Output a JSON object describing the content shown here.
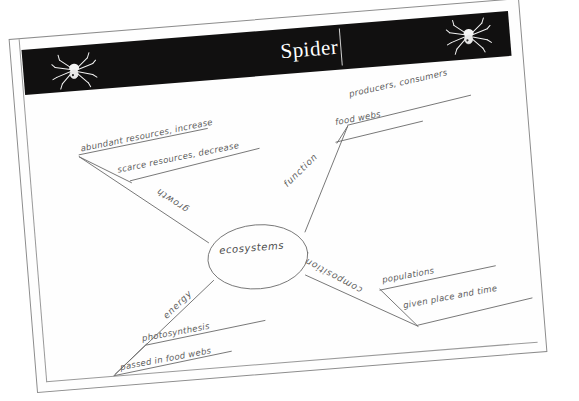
{
  "document": {
    "type": "worksheet-scan",
    "banner": {
      "title": "Spider",
      "background_color": "#111010",
      "title_color": "#ffffff",
      "left_icon": "spider-icon",
      "right_icon": "spider-icon"
    },
    "paper_color": "#fefefe",
    "ink_color": "#5d5d5d"
  },
  "concept_map": {
    "center": {
      "label": "ecosystems"
    },
    "branches": [
      {
        "label": "growth",
        "direction": "upper-left",
        "sub_labels": [
          "abundant resources, increase",
          "scarce resources, decrease"
        ]
      },
      {
        "label": "function",
        "direction": "upper-right",
        "sub_labels": [
          "producers, consumers",
          "food webs"
        ]
      },
      {
        "label": "composition",
        "direction": "lower-right",
        "sub_labels": [
          "populations",
          "given place and time"
        ]
      },
      {
        "label": "energy",
        "direction": "lower-left",
        "sub_labels": [
          "photosynthesis",
          "passed in food webs"
        ]
      }
    ]
  }
}
